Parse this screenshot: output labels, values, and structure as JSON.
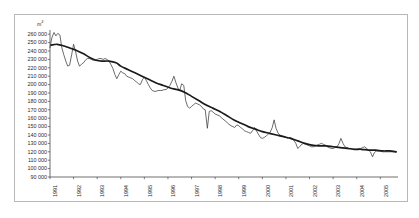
{
  "chart_data": {
    "type": "line",
    "title": "",
    "subtitle": "",
    "xlabel": "",
    "ylabel": "",
    "unit_label": "m",
    "unit_exponent": "3",
    "grid": false,
    "legend_position": "none",
    "xlim": [
      1991.0,
      2005.75
    ],
    "ylim": [
      90000,
      265000
    ],
    "ytick_labels": [
      "260 000",
      "250 000",
      "240 000",
      "230 000",
      "220 000",
      "210 000",
      "200 000",
      "190 000",
      "180 000",
      "170 000",
      "160 000",
      "150 000",
      "140 000",
      "130 000",
      "120 000",
      "110 000",
      "100 000",
      "90 000"
    ],
    "ytick_values": [
      260000,
      250000,
      240000,
      230000,
      220000,
      210000,
      200000,
      190000,
      180000,
      170000,
      160000,
      150000,
      140000,
      130000,
      120000,
      110000,
      100000,
      90000
    ],
    "xtick_labels": [
      "1991",
      "1992",
      "1993",
      "1994",
      "1995",
      "1996",
      "1997",
      "1998",
      "1999",
      "2000",
      "2001",
      "2002",
      "2003",
      "2004",
      "2005"
    ],
    "xtick_values": [
      1991,
      1992,
      1993,
      1994,
      1995,
      1996,
      1997,
      1998,
      1999,
      2000,
      2001,
      2002,
      2003,
      2004,
      2005
    ],
    "series": [
      {
        "name": "monthly-series",
        "style": "thin-jagged",
        "color": "#3a3a3a",
        "x": [
          1991.0,
          1991.08,
          1991.17,
          1991.25,
          1991.33,
          1991.42,
          1991.5,
          1991.58,
          1991.67,
          1991.75,
          1991.83,
          1991.92,
          1992.0,
          1992.08,
          1992.17,
          1992.25,
          1992.33,
          1992.42,
          1992.5,
          1992.58,
          1992.67,
          1992.75,
          1992.83,
          1992.92,
          1993.0,
          1993.08,
          1993.17,
          1993.25,
          1993.33,
          1993.42,
          1993.5,
          1993.58,
          1993.67,
          1993.75,
          1993.83,
          1993.92,
          1994.0,
          1994.08,
          1994.17,
          1994.25,
          1994.33,
          1994.42,
          1994.5,
          1994.58,
          1994.67,
          1994.75,
          1994.83,
          1994.92,
          1995.0,
          1995.08,
          1995.17,
          1995.25,
          1995.33,
          1995.42,
          1995.5,
          1995.58,
          1995.67,
          1995.75,
          1995.83,
          1995.92,
          1996.0,
          1996.08,
          1996.17,
          1996.25,
          1996.33,
          1996.42,
          1996.5,
          1996.58,
          1996.67,
          1996.75,
          1996.83,
          1996.92,
          1997.0,
          1997.08,
          1997.17,
          1997.25,
          1997.33,
          1997.42,
          1997.5,
          1997.58,
          1997.67,
          1997.75,
          1997.83,
          1997.92,
          1998.0,
          1998.08,
          1998.17,
          1998.25,
          1998.33,
          1998.42,
          1998.5,
          1998.58,
          1998.67,
          1998.75,
          1998.83,
          1998.92,
          1999.0,
          1999.08,
          1999.17,
          1999.25,
          1999.33,
          1999.42,
          1999.5,
          1999.58,
          1999.67,
          1999.75,
          1999.83,
          1999.92,
          2000.0,
          2000.08,
          2000.17,
          2000.25,
          2000.33,
          2000.42,
          2000.5,
          2000.58,
          2000.67,
          2000.75,
          2000.83,
          2000.92,
          2001.0,
          2001.08,
          2001.17,
          2001.25,
          2001.33,
          2001.42,
          2001.5,
          2001.58,
          2001.67,
          2001.75,
          2001.83,
          2001.92,
          2002.0,
          2002.08,
          2002.17,
          2002.25,
          2002.33,
          2002.42,
          2002.5,
          2002.58,
          2002.67,
          2002.75,
          2002.83,
          2002.92,
          2003.0,
          2003.08,
          2003.17,
          2003.25,
          2003.33,
          2003.42,
          2003.5,
          2003.58,
          2003.67,
          2003.75,
          2003.83,
          2003.92,
          2004.0,
          2004.08,
          2004.17,
          2004.25,
          2004.33,
          2004.42,
          2004.5,
          2004.58,
          2004.67,
          2004.75,
          2004.83,
          2004.92,
          2005.0,
          2005.08,
          2005.17,
          2005.25,
          2005.33,
          2005.42,
          2005.5,
          2005.58,
          2005.67
        ],
        "y": [
          244000,
          256000,
          262000,
          258000,
          261000,
          259000,
          244000,
          236000,
          228000,
          222000,
          223000,
          236000,
          248000,
          240000,
          228000,
          222000,
          224000,
          226000,
          229000,
          231000,
          231000,
          230000,
          229000,
          229000,
          230000,
          231000,
          231000,
          230000,
          231000,
          230000,
          228000,
          224000,
          219000,
          212000,
          207000,
          212000,
          216000,
          214000,
          213000,
          210000,
          209000,
          208000,
          207000,
          205000,
          203000,
          201000,
          200000,
          206000,
          209000,
          205000,
          200000,
          196000,
          193000,
          192000,
          192000,
          193000,
          193000,
          193000,
          194000,
          194000,
          196000,
          199000,
          204000,
          210000,
          203000,
          196000,
          193000,
          201000,
          199000,
          181000,
          174000,
          172000,
          174000,
          176000,
          178000,
          177000,
          176000,
          174000,
          171000,
          170000,
          148000,
          168000,
          169000,
          167000,
          165000,
          164000,
          163000,
          161000,
          159000,
          157000,
          155000,
          153000,
          151000,
          150000,
          149000,
          152000,
          151000,
          149000,
          147000,
          145000,
          144000,
          143000,
          142000,
          145000,
          149000,
          145000,
          141000,
          137000,
          136000,
          137000,
          139000,
          141000,
          143000,
          149000,
          158000,
          148000,
          142000,
          140000,
          139000,
          138000,
          137000,
          136000,
          137000,
          136000,
          134000,
          130000,
          124000,
          126000,
          129000,
          130000,
          129000,
          128000,
          127000,
          126000,
          126000,
          127000,
          128000,
          129000,
          130000,
          129000,
          128000,
          126000,
          125000,
          124000,
          124000,
          125000,
          126000,
          130000,
          136000,
          130000,
          126000,
          125000,
          124000,
          124000,
          123000,
          123000,
          123000,
          124000,
          124000,
          125000,
          126000,
          124000,
          122000,
          120000,
          114000,
          119000,
          121000,
          121000,
          121000,
          120000,
          120000,
          120000,
          120000,
          120000,
          120000,
          120000,
          120000
        ]
      },
      {
        "name": "trend-series",
        "style": "thick-smooth",
        "color": "#1a1a1a",
        "x": [
          1991.05,
          1991.3,
          1991.6,
          1991.9,
          1992.1,
          1992.4,
          1992.7,
          1992.95,
          1993.2,
          1993.5,
          1993.8,
          1994.0,
          1994.3,
          1994.6,
          1994.9,
          1995.2,
          1995.5,
          1995.8,
          1996.1,
          1996.4,
          1996.7,
          1997.0,
          1997.3,
          1997.6,
          1997.9,
          1998.2,
          1998.5,
          1998.8,
          1999.1,
          1999.4,
          1999.7,
          2000.0,
          2000.3,
          2000.6,
          2000.9,
          2001.2,
          2001.5,
          2001.8,
          2002.1,
          2002.4,
          2002.7,
          2003.0,
          2003.3,
          2003.6,
          2003.9,
          2004.2,
          2004.5,
          2004.8,
          2005.1,
          2005.4,
          2005.67
        ],
        "y": [
          247000,
          248000,
          246000,
          243000,
          241000,
          237000,
          232000,
          229000,
          228000,
          228000,
          226000,
          222000,
          218000,
          214000,
          210000,
          206000,
          202000,
          199000,
          196000,
          194000,
          191000,
          186000,
          181000,
          176000,
          172000,
          168000,
          163000,
          158000,
          154000,
          150000,
          147000,
          144000,
          142000,
          140000,
          138000,
          136000,
          133000,
          130000,
          128000,
          127000,
          127000,
          126000,
          125000,
          124000,
          123000,
          123000,
          122000,
          122000,
          121000,
          121000,
          120000
        ]
      }
    ],
    "annotations": [
      {
        "label": "peak-1991",
        "value": 262000
      },
      {
        "label": "spike-1996",
        "value": 210000
      },
      {
        "label": "trough-1997",
        "value": 148000
      },
      {
        "label": "spike-2000",
        "value": 158000
      },
      {
        "label": "trough-2001",
        "value": 124000
      },
      {
        "label": "endpoint-2005",
        "value": 120000
      }
    ],
    "colors": {
      "frame": "#b8b8b8",
      "axis": "#4a4a4a",
      "monthly_line": "#3a3a3a",
      "trend_line": "#1a1a1a",
      "tick_text": "#2b2b2b",
      "background": "#ffffff"
    }
  }
}
